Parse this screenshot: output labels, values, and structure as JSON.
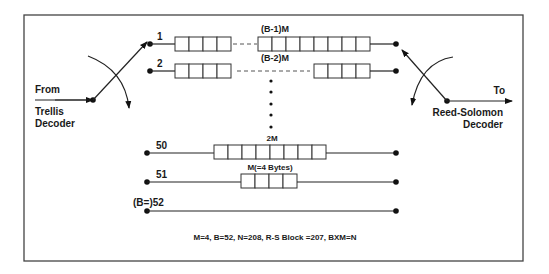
{
  "diagram": {
    "input": {
      "label_top": "From",
      "label_bottom_1": "Trellis",
      "label_bottom_2": "Decoder"
    },
    "output": {
      "label_top": "To",
      "label_bottom_1": "Reed-Solomon",
      "label_bottom_2": "Decoder"
    },
    "branches": [
      {
        "index": "1",
        "delay_label": "(B-1)M",
        "left_cells": 4,
        "right_cells": 8
      },
      {
        "index": "2",
        "delay_label": "(B-2)M",
        "left_cells": 4,
        "right_cells": 4
      },
      {
        "index": "50",
        "delay_label": "2M",
        "cells": 8
      },
      {
        "index": "51",
        "delay_label": "M(=4 Bytes)",
        "cells": 4
      },
      {
        "index": "(B=)52",
        "delay_label": "",
        "cells": 0
      }
    ],
    "ellipsis_dots": 5,
    "parameters": "M=4, B=52, N=208, R-S Block =207, BXM=N"
  }
}
